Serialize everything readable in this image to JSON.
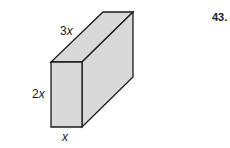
{
  "problem_number": "43.",
  "figure": {
    "type": "rectangular-prism",
    "colors": {
      "face_fill": "#d9d9d9",
      "edge_stroke": "#1a1a1a",
      "background": "#ffffff"
    },
    "dimensions": {
      "depth": {
        "coefficient": "3",
        "variable": "x"
      },
      "height": {
        "coefficient": "2",
        "variable": "x"
      },
      "width": {
        "coefficient": "",
        "variable": "x"
      }
    }
  }
}
